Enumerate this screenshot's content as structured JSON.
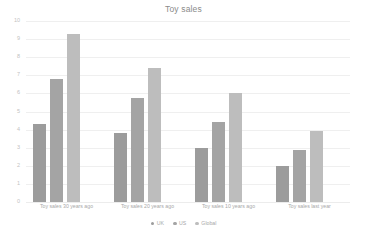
{
  "chart_data": {
    "type": "bar",
    "title": "Toy sales",
    "xlabel": "",
    "ylabel": "",
    "ylim": [
      0,
      10
    ],
    "ytick_step": 1,
    "yticks": [
      "0",
      "1",
      "2",
      "3",
      "4",
      "5",
      "6",
      "7",
      "8",
      "9",
      "10"
    ],
    "grid": true,
    "legend_position": "bottom",
    "categories": [
      "Toy sales 30 years ago",
      "Toy sales 20 years ago",
      "Toy sales 10 years ago",
      "Toy sales last year"
    ],
    "series": [
      {
        "name": "UK",
        "color": "#9c9c9c",
        "values": [
          4.3,
          3.8,
          3.0,
          2.0
        ]
      },
      {
        "name": "US",
        "color": "#a4a4a4",
        "values": [
          6.8,
          5.75,
          4.4,
          2.85
        ]
      },
      {
        "name": "Global",
        "color": "#bdbdbd",
        "values": [
          9.3,
          7.4,
          6.0,
          3.9
        ]
      }
    ]
  },
  "colors": {
    "background": "#ffffff",
    "gridline": "#efefef",
    "title_text": "#8a8a8a",
    "tick_text": "#a8a8a8",
    "ytick_text": "#c2c2c2"
  }
}
